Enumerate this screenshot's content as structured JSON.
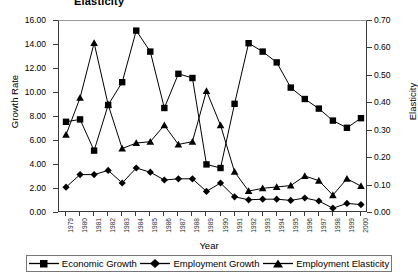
{
  "chart_data": {
    "type": "line",
    "title": "Elasticity",
    "xlabel": "Year",
    "ylabel": "Growth Rate",
    "y2label": "Elasticity",
    "grid": false,
    "legend_position": "bottom",
    "ylim": [
      0.0,
      16.0
    ],
    "y2lim": [
      0.0,
      0.7
    ],
    "ytick_labels": [
      "16.00",
      "14.00",
      "12.00",
      "10.00",
      "8.00",
      "6.00",
      "4.00",
      "2.00",
      "0.00"
    ],
    "ytick_values": [
      16.0,
      14.0,
      12.0,
      10.0,
      8.0,
      6.0,
      4.0,
      2.0,
      0.0
    ],
    "y2tick_labels": [
      "0.70",
      "0.60",
      "0.50",
      "0.40",
      "0.30",
      "0.20",
      "0.10",
      "0.00"
    ],
    "y2tick_values": [
      0.7,
      0.6,
      0.5,
      0.4,
      0.3,
      0.2,
      0.1,
      0.0
    ],
    "categories": [
      "1979",
      "1980",
      "1981",
      "1982",
      "1983",
      "1984",
      "1985",
      "1986",
      "1987",
      "1988",
      "1989",
      "1990",
      "1991",
      "1992",
      "1993",
      "1994",
      "1995",
      "1996",
      "1997",
      "1998",
      "1999",
      "2000"
    ],
    "series": [
      {
        "name": "Economic Growth",
        "axis": "left",
        "marker": "square",
        "values": [
          7.6,
          7.8,
          5.2,
          9.0,
          10.9,
          15.2,
          13.45,
          8.75,
          11.6,
          11.25,
          4.05,
          3.75,
          9.1,
          14.15,
          13.45,
          12.55,
          10.45,
          9.5,
          8.7,
          7.7,
          7.1,
          7.9
        ]
      },
      {
        "name": "Employment Growth",
        "axis": "left",
        "marker": "diamond",
        "values": [
          2.15,
          3.2,
          3.2,
          3.55,
          2.5,
          3.75,
          3.4,
          2.75,
          2.85,
          2.85,
          1.8,
          2.5,
          1.35,
          1.1,
          1.15,
          1.15,
          1.05,
          1.25,
          1.0,
          0.4,
          0.8,
          0.7
        ]
      },
      {
        "name": "Employment Elasticity",
        "axis": "right",
        "marker": "triangle",
        "values": [
          0.285,
          0.42,
          0.62,
          0.395,
          0.235,
          0.255,
          0.26,
          0.32,
          0.25,
          0.26,
          0.445,
          0.32,
          0.15,
          0.08,
          0.09,
          0.095,
          0.1,
          0.135,
          0.118,
          0.065,
          0.125,
          0.098
        ]
      }
    ]
  },
  "legend": {
    "items": [
      {
        "label": "Economic Growth",
        "marker": "square-marker-icon"
      },
      {
        "label": "Employment Growth",
        "marker": "diamond-marker-icon"
      },
      {
        "label": "Employment Elasticity",
        "marker": "triangle-marker-icon"
      }
    ]
  }
}
